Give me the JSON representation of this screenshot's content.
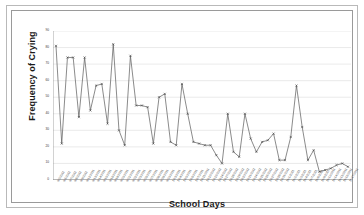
{
  "figure": {
    "kind": "line-chart-image",
    "background": "#ffffff",
    "frame_color": "#9a9a9a",
    "outer_frame_color": "#b9b9b9"
  },
  "chart_data": {
    "type": "line",
    "title": "",
    "xlabel": "School Days",
    "ylabel": "Frequency of Crying",
    "ylim": [
      0,
      90
    ],
    "ytick_step": 10,
    "grid": true,
    "grid_axis": "y",
    "legend": false,
    "line_color": "#595959",
    "marker": "x",
    "marker_color": "#404040",
    "yticks": [
      0,
      10,
      20,
      30,
      40,
      50,
      60,
      70,
      80,
      90
    ],
    "ytick_labels": [
      "0",
      "10",
      "20",
      "30",
      "40",
      "50",
      "60",
      "70",
      "80",
      "90"
    ],
    "categories": [
      "9/2/2011",
      "9/6/2011",
      "9/7/2011",
      "9/8/2011",
      "9/9/2011",
      "9/12/2011",
      "9/13/2011",
      "9/14/2011",
      "9/15/2011",
      "9/16/2011",
      "9/19/2011",
      "9/20/2011",
      "9/21/2011",
      "9/22/2011",
      "9/23/2011",
      "9/26/2011",
      "9/27/2011",
      "9/28/2011",
      "9/29/2011",
      "9/30/2011",
      "10/3/2011",
      "10/4/2011",
      "10/5/2011",
      "10/6/2011",
      "10/7/2011",
      "10/11/2011",
      "10/12/2011",
      "10/13/2011",
      "10/14/2011",
      "10/17/2011",
      "10/18/2011",
      "10/19/2011",
      "10/20/2011",
      "10/21/2011",
      "10/24/2011",
      "10/25/2011",
      "10/26/2011",
      "10/27/2011",
      "10/28/2011",
      "10/31/2011",
      "11/1/2011",
      "11/2/2011",
      "11/3/2011",
      "11/4/2011",
      "11/7/2011",
      "11/8/2011",
      "11/9/2011",
      "11/10/2011",
      "11/14/2011",
      "11/15/2011",
      "11/16/2011",
      "11/17/2011"
    ],
    "values": [
      81,
      22,
      74,
      74,
      38,
      74,
      42,
      57,
      58,
      34,
      82,
      30,
      21,
      75,
      45,
      45,
      44,
      22,
      50,
      52,
      23,
      21,
      58,
      40,
      23,
      22,
      21,
      21,
      15,
      10,
      40,
      17,
      14,
      40,
      25,
      17,
      23,
      24,
      28,
      12,
      12,
      26,
      57,
      32,
      12,
      18,
      5,
      6,
      7,
      9,
      10,
      8
    ]
  }
}
